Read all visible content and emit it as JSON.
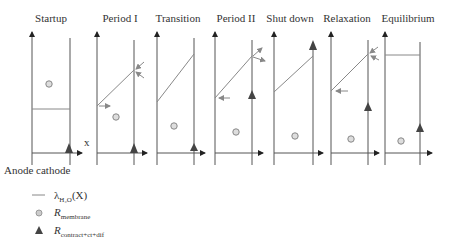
{
  "panels": [
    {
      "title": "Startup"
    },
    {
      "title": "Period I"
    },
    {
      "title": "Transition"
    },
    {
      "title": "Period II"
    },
    {
      "title": "Shut down"
    },
    {
      "title": "Relaxation"
    },
    {
      "title": "Equilibrium"
    }
  ],
  "axis": {
    "x_label": "x",
    "electrode_label": "Anode cathode"
  },
  "legend": {
    "line_symbol": "λ",
    "line_sub": "H₂O",
    "line_suffix": "(X)",
    "membrane_symbol": "R",
    "membrane_sub": "membrane",
    "contract_symbol": "R",
    "contract_sub": "contract+ct+dif"
  },
  "colors": {
    "axis": "#555555",
    "line": "#888888",
    "arrow": "#888888",
    "circle": "#888888",
    "triangle": "#444444"
  }
}
